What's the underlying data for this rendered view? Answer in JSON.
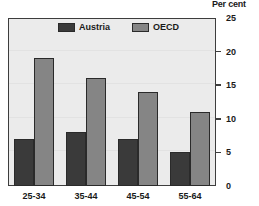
{
  "chart_data": {
    "type": "bar",
    "title": "",
    "axis_title": "Per cent",
    "xlabel": "",
    "ylabel": "Per cent",
    "categories": [
      "25-34",
      "35-44",
      "45-54",
      "55-64"
    ],
    "series": [
      {
        "name": "Austria",
        "color": "#3a3a3a",
        "values": [
          7,
          8,
          7,
          5
        ]
      },
      {
        "name": "OECD",
        "color": "#858585",
        "values": [
          19,
          16,
          14,
          11
        ]
      }
    ],
    "ylim": [
      0,
      25
    ],
    "yticks": [
      0,
      5,
      10,
      15,
      20,
      25
    ],
    "ytick_labels": [
      "0",
      "5",
      "10",
      "15",
      "20",
      "25"
    ],
    "grid": true,
    "legend_position": "top-center",
    "axis_side": "right",
    "plot_background": "#ebebeb",
    "frame_color": "#3d3d3d"
  }
}
